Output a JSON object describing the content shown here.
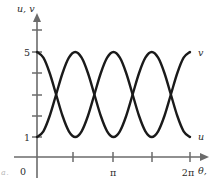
{
  "figure": {
    "axis_color": "#6b6b6b",
    "curve_color": "#1a1a1a",
    "y_axis_label": "u, v",
    "x_axis_label": "θ,",
    "origin_label": "0",
    "caption_fragment": "a."
  },
  "curve_labels": {
    "upper_right": "v",
    "lower_right": "u"
  },
  "chart_data": {
    "type": "line",
    "title": "",
    "subtitle": "",
    "xlabel": "θ,",
    "ylabel": "u, v",
    "xlim": [
      0,
      6.2832
    ],
    "ylim": [
      0,
      6
    ],
    "grid": false,
    "legend": "inline-at-curve-ends",
    "x_ticks": [
      0,
      1.5708,
      3.1416,
      4.7124,
      6.2832
    ],
    "x_ticklabels": [
      "0",
      "",
      "π",
      "",
      "2π"
    ],
    "y_ticks": [
      1,
      2,
      3,
      4,
      5,
      6
    ],
    "y_ticklabels": [
      "1",
      "",
      "",
      "",
      "5",
      ""
    ],
    "series": [
      {
        "name": "u",
        "label_position": "lower-right",
        "description": "starts at maximum 5 at theta=0, falls to minimum 1, rises to maximum 5, ends at minimum 1 at theta=2pi",
        "amplitude": 2,
        "offset": 3,
        "period_in_pi": 1.3333,
        "phase": "cosine-peak-at-zero",
        "points": [
          {
            "x": 0.0,
            "y": 5.0
          },
          {
            "x": 0.2618,
            "y": 4.73
          },
          {
            "x": 0.5236,
            "y": 4.0
          },
          {
            "x": 0.7854,
            "y": 3.0
          },
          {
            "x": 1.0472,
            "y": 2.0
          },
          {
            "x": 1.309,
            "y": 1.27
          },
          {
            "x": 1.5708,
            "y": 1.0
          },
          {
            "x": 1.8326,
            "y": 1.27
          },
          {
            "x": 2.0944,
            "y": 2.0
          },
          {
            "x": 2.3562,
            "y": 3.0
          },
          {
            "x": 2.618,
            "y": 4.0
          },
          {
            "x": 2.8798,
            "y": 4.73
          },
          {
            "x": 3.1416,
            "y": 5.0
          },
          {
            "x": 3.4034,
            "y": 4.73
          },
          {
            "x": 3.6652,
            "y": 4.0
          },
          {
            "x": 3.927,
            "y": 3.0
          },
          {
            "x": 4.1888,
            "y": 2.0
          },
          {
            "x": 4.4506,
            "y": 1.27
          },
          {
            "x": 4.7124,
            "y": 1.0
          },
          {
            "x": 4.9742,
            "y": 1.27
          },
          {
            "x": 5.236,
            "y": 2.0
          },
          {
            "x": 5.4978,
            "y": 3.0
          },
          {
            "x": 5.7596,
            "y": 4.0
          },
          {
            "x": 6.0214,
            "y": 4.73
          },
          {
            "x": 6.2832,
            "y": 5.0
          }
        ]
      },
      {
        "name": "v",
        "label_position": "upper-right",
        "description": "starts at minimum 1 at theta=0, rises to maximum 5 at theta=pi, falls to minimum 1, rises to maximum 5 at theta=2pi",
        "amplitude": 2,
        "offset": 3,
        "period_in_pi": 1.3333,
        "phase": "cosine-trough-at-zero",
        "points": [
          {
            "x": 0.0,
            "y": 1.0
          },
          {
            "x": 0.2618,
            "y": 1.27
          },
          {
            "x": 0.5236,
            "y": 2.0
          },
          {
            "x": 0.7854,
            "y": 3.0
          },
          {
            "x": 1.0472,
            "y": 4.0
          },
          {
            "x": 1.309,
            "y": 4.73
          },
          {
            "x": 1.5708,
            "y": 5.0
          },
          {
            "x": 1.8326,
            "y": 4.73
          },
          {
            "x": 2.0944,
            "y": 4.0
          },
          {
            "x": 2.3562,
            "y": 3.0
          },
          {
            "x": 2.618,
            "y": 2.0
          },
          {
            "x": 2.8798,
            "y": 1.27
          },
          {
            "x": 3.1416,
            "y": 1.0
          },
          {
            "x": 3.4034,
            "y": 1.27
          },
          {
            "x": 3.6652,
            "y": 2.0
          },
          {
            "x": 3.927,
            "y": 3.0
          },
          {
            "x": 4.1888,
            "y": 4.0
          },
          {
            "x": 4.4506,
            "y": 4.73
          },
          {
            "x": 4.7124,
            "y": 5.0
          },
          {
            "x": 4.9742,
            "y": 4.73
          },
          {
            "x": 5.236,
            "y": 4.0
          },
          {
            "x": 5.4978,
            "y": 3.0
          },
          {
            "x": 5.7596,
            "y": 2.0
          },
          {
            "x": 6.0214,
            "y": 1.27
          },
          {
            "x": 6.2832,
            "y": 1.0
          }
        ]
      }
    ],
    "intersections": [
      {
        "x": 0.7854,
        "y": 3.0
      },
      {
        "x": 2.3562,
        "y": 3.0
      },
      {
        "x": 3.927,
        "y": 3.0
      },
      {
        "x": 5.4978,
        "y": 3.0
      }
    ]
  }
}
